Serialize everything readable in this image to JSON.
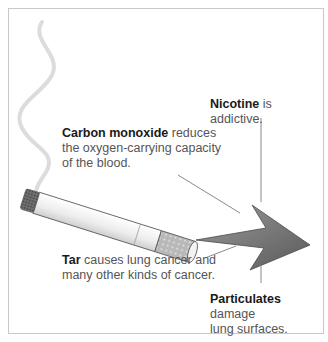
{
  "diagram": {
    "labels": {
      "nicotine": {
        "term": "Nicotine",
        "text": " is addictive."
      },
      "carbon_monoxide": {
        "term": "Carbon monoxide",
        "line1_rest": " reduces",
        "line2": "the oxygen-carrying capacity",
        "line3": "of the blood."
      },
      "tar": {
        "term": "Tar",
        "line1_rest": " causes lung cancer and",
        "line2": "many other kinds of cancer."
      },
      "particulates": {
        "term": "Particulates",
        "line1_rest": " damage",
        "line2": "lung surfaces."
      }
    },
    "elements": [
      "smoke-trail",
      "cigarette",
      "filter",
      "smoke-arrow",
      "leader-lines"
    ],
    "colors": {
      "border": "#c8c8c8",
      "arrow": "#707070",
      "smoke": "#dcdcdc",
      "term_text": "#1a1a1a",
      "body_text": "#555555"
    }
  }
}
